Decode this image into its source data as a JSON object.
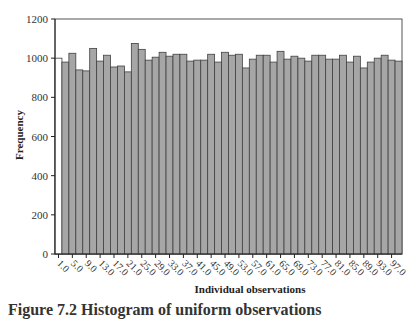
{
  "chart_data": {
    "type": "bar",
    "title": "",
    "xlabel": "Individual observations",
    "ylabel": "Frequency",
    "ylim": [
      0,
      1200
    ],
    "yticks": [
      0,
      200,
      400,
      600,
      800,
      1000,
      1200
    ],
    "xtick_labels": [
      "1.0",
      "5.0",
      "9.0",
      "13.0",
      "17.0",
      "21.0",
      "25.0",
      "29.0",
      "33.0",
      "37.0",
      "41.0",
      "45.0",
      "49.0",
      "53.0",
      "57.0",
      "61.0",
      "65.0",
      "69.0",
      "73.0",
      "77.0",
      "81.0",
      "85.0",
      "89.0",
      "93.0",
      "97.0"
    ],
    "grid": false,
    "legend": null,
    "bar_color": "#a6a6a6",
    "bar_edge_color": "#404040",
    "first_bar_color": "#ffffff",
    "categories": [
      1,
      3,
      5,
      7,
      9,
      11,
      13,
      15,
      17,
      19,
      21,
      23,
      25,
      27,
      29,
      31,
      33,
      35,
      37,
      39,
      41,
      43,
      45,
      47,
      49,
      51,
      53,
      55,
      57,
      59,
      61,
      63,
      65,
      67,
      69,
      71,
      73,
      75,
      77,
      79,
      81,
      83,
      85,
      87,
      89,
      91,
      93,
      95,
      97,
      99
    ],
    "values": [
      1000,
      980,
      1025,
      940,
      935,
      1050,
      985,
      1015,
      955,
      960,
      930,
      1075,
      1045,
      990,
      1005,
      1030,
      1010,
      1020,
      1020,
      985,
      990,
      990,
      1020,
      980,
      1030,
      1015,
      1020,
      950,
      995,
      1015,
      1015,
      980,
      1035,
      995,
      1010,
      1000,
      985,
      1015,
      1015,
      995,
      995,
      1015,
      980,
      1010,
      950,
      980,
      1000,
      1015,
      990,
      985
    ]
  },
  "caption": "Figure 7.2  Histogram of uniform observations"
}
